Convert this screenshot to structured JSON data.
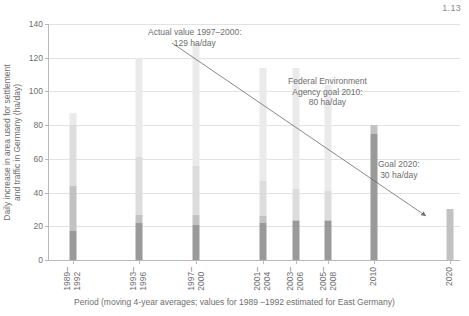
{
  "corner_label": "1.13",
  "chart_data": {
    "type": "bar",
    "title": "",
    "xlabel": "Period (moving 4-year averages; values for 1989 –1992 estimated for East Germany)",
    "ylabel_lines": [
      "Daily increase in area used for settlement",
      "and traffic in Germany (ha/day)"
    ],
    "ylim": [
      0,
      140
    ],
    "yticks": [
      0,
      20,
      40,
      60,
      80,
      100,
      120,
      140
    ],
    "grid": true,
    "legend": "none",
    "categories": [
      "1989–\n1992",
      "1993–\n1996",
      "1997–\n2000",
      "2001–\n2004",
      "2003–\n2006",
      "2005–\n2008",
      "2010",
      "2020"
    ],
    "category_labels": [
      {
        "top": "1989–",
        "bottom": "1992"
      },
      {
        "top": "1993–",
        "bottom": "1996"
      },
      {
        "top": "1997–",
        "bottom": "2000"
      },
      {
        "top": "2001–",
        "bottom": "2004"
      },
      {
        "top": "2003–",
        "bottom": "2006"
      },
      {
        "top": "2005–",
        "bottom": "2008"
      },
      {
        "top": "",
        "bottom": "2010"
      },
      {
        "top": "",
        "bottom": "2020"
      }
    ],
    "values": [
      87,
      120,
      129,
      114,
      114,
      104,
      80,
      30
    ],
    "series": [
      {
        "name": "settlement and traffic total",
        "values": [
          87,
          120,
          129,
          114,
          114,
          104,
          80,
          30
        ]
      },
      {
        "name": "lower dark segment",
        "values": [
          17,
          22,
          21,
          22,
          23,
          23,
          75,
          0
        ]
      },
      {
        "name": "mid segment top",
        "values": [
          44,
          27,
          27,
          26,
          24,
          24,
          80,
          30
        ]
      },
      {
        "name": "upper light segment top",
        "values": [
          80,
          61,
          56,
          47,
          42,
          41,
          80,
          30
        ]
      }
    ],
    "annotations": [
      {
        "id": "actual-value",
        "lines": [
          "Actual value 1997–2000:",
          "129 ha/day"
        ],
        "value": 129,
        "unit": "ha/day",
        "period": "1997–2000"
      },
      {
        "id": "federal-goal-2010",
        "lines": [
          "Federal Environment",
          "Agency goal 2010:",
          "80 ha/day"
        ],
        "value": 80,
        "unit": "ha/day",
        "period": "2010"
      },
      {
        "id": "goal-2020",
        "lines": [
          "Goal 2020:",
          "30 ha/day"
        ],
        "value": 30,
        "unit": "ha/day",
        "period": "2020"
      }
    ],
    "trend_arrow": {
      "from_value": 129,
      "from_category": "1997–2000",
      "to_value": 30,
      "to_category": "2020",
      "style": "solid-thin-with-arrowhead"
    },
    "colors": {
      "axis": "#b9b9b9",
      "grid": "#e2e2e2",
      "text": "#6e6e6e",
      "bar_dark": "#9a9a9a",
      "bar_mid": "#c2c2c2",
      "bar_light": "#dcdcdc",
      "bar_pale": "#eaeaea",
      "arrow": "#6b6b6b"
    }
  }
}
